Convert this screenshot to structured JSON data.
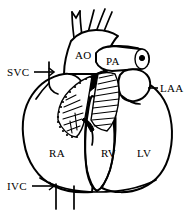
{
  "figure": {
    "background_color": "#ffffff",
    "stroke_color": "#000000",
    "width": 194,
    "height": 213
  },
  "labels": {
    "svc": "SVC",
    "ao": "AO",
    "pa": "PA",
    "laa": "LAA",
    "ra": "RA",
    "rv": "RV",
    "lv": "LV",
    "ivc": "IVC"
  },
  "structures": [
    {
      "key": "svc",
      "name": "superior-vena-cava",
      "abbr": "SVC",
      "has_leader": true
    },
    {
      "key": "ao",
      "name": "aorta",
      "abbr": "AO",
      "has_leader": false
    },
    {
      "key": "pa",
      "name": "pulmonary-artery",
      "abbr": "PA",
      "has_leader": false
    },
    {
      "key": "laa",
      "name": "left-atrial-appendage",
      "abbr": "LAA",
      "has_leader": true
    },
    {
      "key": "ra",
      "name": "right-atrium",
      "abbr": "RA",
      "has_leader": false
    },
    {
      "key": "rv",
      "name": "right-ventricle",
      "abbr": "RV",
      "has_leader": false
    },
    {
      "key": "lv",
      "name": "left-ventricle",
      "abbr": "LV",
      "has_leader": false
    },
    {
      "key": "ivc",
      "name": "inferior-vena-cava",
      "abbr": "IVC",
      "has_leader": true
    }
  ]
}
